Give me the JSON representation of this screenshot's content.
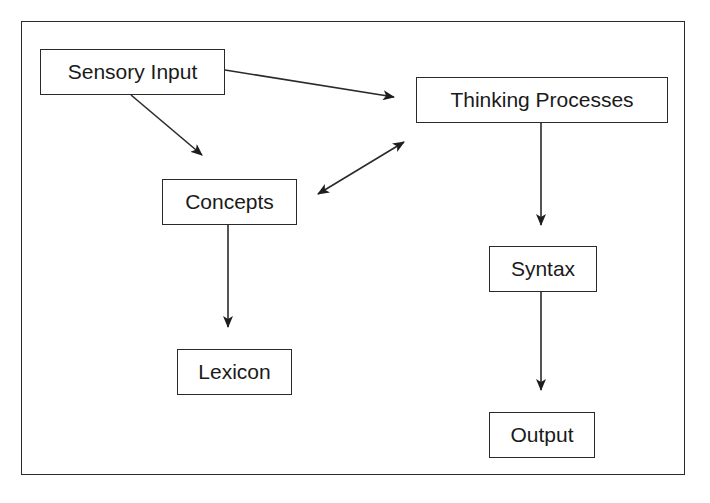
{
  "diagram": {
    "type": "flowchart",
    "nodes": [
      {
        "id": "sensory",
        "label": "Sensory Input"
      },
      {
        "id": "thinking",
        "label": "Thinking Processes"
      },
      {
        "id": "concepts",
        "label": "Concepts"
      },
      {
        "id": "syntax",
        "label": "Syntax"
      },
      {
        "id": "lexicon",
        "label": "Lexicon"
      },
      {
        "id": "output",
        "label": "Output"
      }
    ],
    "edges": [
      {
        "from": "sensory",
        "to": "thinking",
        "direction": "forward"
      },
      {
        "from": "sensory",
        "to": "concepts",
        "direction": "forward"
      },
      {
        "from": "concepts",
        "to": "thinking",
        "direction": "bidirectional"
      },
      {
        "from": "thinking",
        "to": "syntax",
        "direction": "forward"
      },
      {
        "from": "concepts",
        "to": "lexicon",
        "direction": "forward"
      },
      {
        "from": "syntax",
        "to": "output",
        "direction": "forward"
      }
    ],
    "colors": {
      "line": "#2a2a2a",
      "background": "#ffffff",
      "text": "#1a1a1a"
    }
  }
}
